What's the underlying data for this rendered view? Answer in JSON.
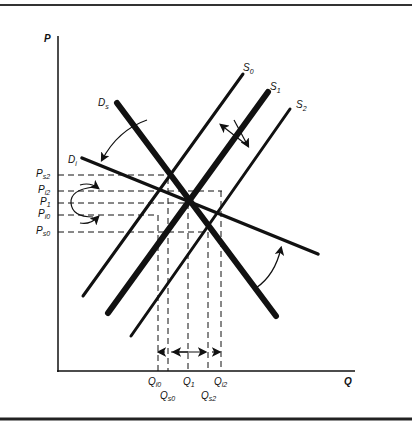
{
  "axes": {
    "y_label": "P",
    "x_label": "Q"
  },
  "curves": {
    "S0": {
      "name": "S",
      "sub": "0"
    },
    "S1": {
      "name": "S",
      "sub": "1"
    },
    "S2": {
      "name": "S",
      "sub": "2"
    },
    "Ds": {
      "name": "D",
      "sub": "s"
    },
    "Di": {
      "name": "D",
      "sub": "i"
    }
  },
  "price_labels": [
    {
      "name": "P",
      "sub": "s2"
    },
    {
      "name": "P",
      "sub": "i2"
    },
    {
      "name": "P",
      "sub": "1"
    },
    {
      "name": "P",
      "sub": "i0"
    },
    {
      "name": "P",
      "sub": "s0"
    }
  ],
  "quantity_labels": [
    {
      "name": "Q",
      "sub": "i0"
    },
    {
      "name": "Q",
      "sub": "s0"
    },
    {
      "name": "Q",
      "sub": "1"
    },
    {
      "name": "Q",
      "sub": "s2"
    },
    {
      "name": "Q",
      "sub": "i2"
    }
  ],
  "colors": {
    "ink": "#111111",
    "background": "#ffffff"
  }
}
